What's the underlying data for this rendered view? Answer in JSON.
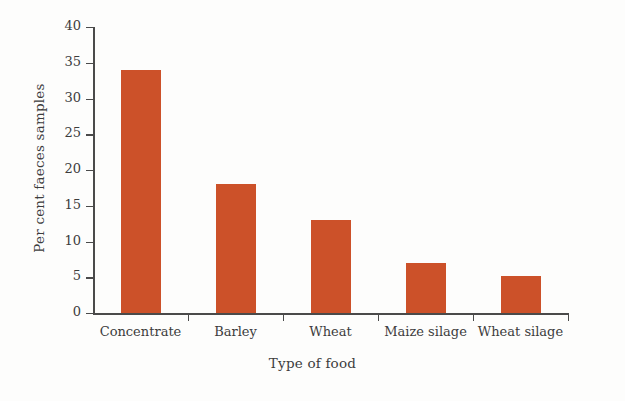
{
  "chart_data": {
    "type": "bar",
    "title": "",
    "subtitle": "",
    "categories": [
      "Concentrate",
      "Barley",
      "Wheat",
      "Maize silage",
      "Wheat silage"
    ],
    "values": [
      34,
      18,
      13,
      7,
      5.2
    ],
    "xlabel": "Type of food",
    "ylabel": "Per cent faeces samples",
    "ylim": [
      0,
      40
    ],
    "yticks": [
      0,
      5,
      10,
      15,
      20,
      25,
      30,
      35,
      40
    ],
    "ytick_labels": [
      "0",
      "5",
      "10",
      "15",
      "20",
      "25",
      "30",
      "35",
      "40"
    ],
    "grid": false,
    "legend": false,
    "legend_position": "none",
    "bar_color": "#cc5129",
    "axis_color": "#4a4a4a",
    "background_color": "#fdfdfc"
  }
}
